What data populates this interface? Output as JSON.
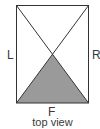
{
  "diagram": {
    "caption": "top view",
    "labels": {
      "left": "L",
      "right": "R",
      "front": "F"
    },
    "colors": {
      "stroke": "#333333",
      "shaded_region": "#9a9a9a",
      "background": "#ffffff"
    },
    "shapes": {
      "rectangle": "outer box with both diagonals",
      "shaded": "triangle from bottom-left corner to bottom-right corner to center intersection"
    }
  }
}
